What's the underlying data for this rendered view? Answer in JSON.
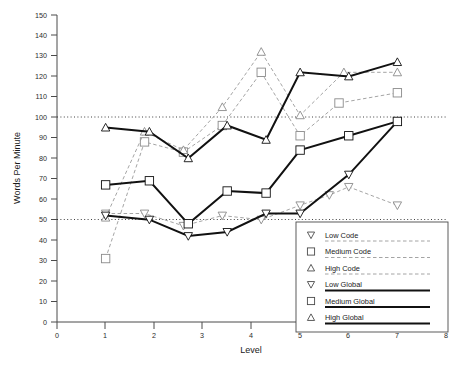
{
  "chart_data": {
    "type": "line",
    "title": "",
    "xlabel": "Level",
    "ylabel": "Words Per Minute",
    "xlim": [
      0,
      8
    ],
    "ylim": [
      0,
      150
    ],
    "xticks": [
      0,
      1,
      2,
      3,
      4,
      5,
      6,
      7,
      8
    ],
    "yticks": [
      0,
      10,
      20,
      30,
      40,
      50,
      60,
      70,
      80,
      90,
      100,
      110,
      120,
      130,
      140,
      150
    ],
    "grid": false,
    "reference_lines": [
      50,
      100
    ],
    "legend_position": "bottom-right",
    "series": [
      {
        "name": "Low Code",
        "marker": "triangle-down",
        "line": "dashed",
        "color": "#9a9a9a",
        "x": [
          1,
          1.8,
          2.6,
          3.4,
          4.2,
          5,
          5.6,
          6,
          7
        ],
        "y": [
          53,
          53,
          47,
          52,
          50,
          57,
          62,
          66,
          57
        ]
      },
      {
        "name": "Medium Code",
        "marker": "square",
        "line": "dashed",
        "color": "#9a9a9a",
        "x": [
          1,
          1.8,
          2.6,
          3.4,
          4.2,
          5,
          5.8,
          7
        ],
        "y": [
          31,
          88,
          83,
          96,
          122,
          91,
          107,
          112
        ]
      },
      {
        "name": "High Code",
        "marker": "triangle-up",
        "line": "dashed",
        "color": "#9a9a9a",
        "x": [
          1,
          1.8,
          2.6,
          3.4,
          4.2,
          5,
          5.9,
          7
        ],
        "y": [
          51,
          93,
          84,
          105,
          132,
          101,
          122,
          122
        ]
      },
      {
        "name": "Low Global",
        "marker": "triangle-down",
        "line": "solid",
        "color": "#111111",
        "x": [
          1,
          1.9,
          2.7,
          3.5,
          4.3,
          5,
          6,
          7
        ],
        "y": [
          52,
          50,
          42,
          44,
          53,
          53,
          72,
          98
        ]
      },
      {
        "name": "Medium Global",
        "marker": "square",
        "line": "solid",
        "color": "#111111",
        "x": [
          1,
          1.9,
          2.7,
          3.5,
          4.3,
          5,
          6,
          7
        ],
        "y": [
          67,
          69,
          48,
          64,
          63,
          84,
          91,
          98
        ]
      },
      {
        "name": "High Global",
        "marker": "triangle-up",
        "line": "solid",
        "color": "#111111",
        "x": [
          1,
          1.9,
          2.7,
          3.5,
          4.3,
          5,
          6,
          7
        ],
        "y": [
          95,
          93,
          80,
          96,
          89,
          122,
          120,
          127
        ]
      }
    ]
  },
  "axes": {
    "y_title": "Words Per Minute",
    "x_title": "Level",
    "y_tick_labels": [
      "0",
      "10",
      "20",
      "30",
      "40",
      "50",
      "60",
      "70",
      "80",
      "90",
      "100",
      "110",
      "120",
      "130",
      "140",
      "150"
    ],
    "x_tick_labels": [
      "0",
      "1",
      "2",
      "3",
      "4",
      "5",
      "6",
      "7",
      "8"
    ]
  },
  "legend": {
    "items": [
      {
        "label": "Low Code",
        "marker": "triangle-down-icon",
        "line": "dashed"
      },
      {
        "label": "Medium Code",
        "marker": "square-icon",
        "line": "dashed"
      },
      {
        "label": "High Code",
        "marker": "triangle-up-icon",
        "line": "dashed"
      },
      {
        "label": "Low Global",
        "marker": "triangle-down-icon",
        "line": "solid"
      },
      {
        "label": "Medium Global",
        "marker": "square-icon",
        "line": "solid"
      },
      {
        "label": "High Global",
        "marker": "triangle-up-icon",
        "line": "solid"
      }
    ]
  },
  "caption": {
    "text": ""
  }
}
